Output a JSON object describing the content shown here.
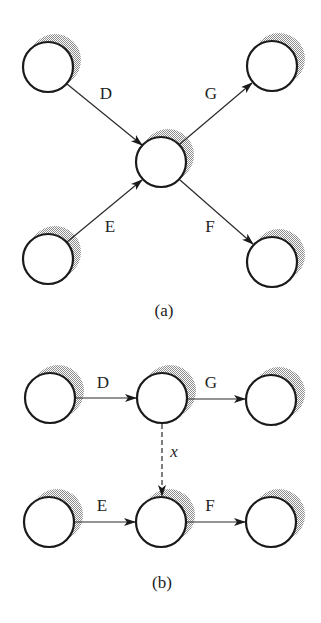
{
  "diagram": {
    "type": "network-activity-diagram",
    "colors": {
      "stroke": "#1a1a1a",
      "shadow": "#9a9a9a",
      "background": "#ffffff"
    },
    "panel_a": {
      "caption": "(a)",
      "nodes": [
        {
          "id": "a-tl",
          "cx": 48,
          "cy": 67
        },
        {
          "id": "a-tr",
          "cx": 272,
          "cy": 66
        },
        {
          "id": "a-center",
          "cx": 161,
          "cy": 162
        },
        {
          "id": "a-bl",
          "cx": 48,
          "cy": 259
        },
        {
          "id": "a-br",
          "cx": 272,
          "cy": 262
        }
      ],
      "edges": [
        {
          "label": "D",
          "from": "a-tl",
          "to": "a-center",
          "style": "solid"
        },
        {
          "label": "E",
          "from": "a-bl",
          "to": "a-center",
          "style": "solid"
        },
        {
          "label": "G",
          "from": "a-center",
          "to": "a-tr",
          "style": "solid"
        },
        {
          "label": "F",
          "from": "a-center",
          "to": "a-br",
          "style": "solid"
        }
      ]
    },
    "panel_b": {
      "caption": "(b)",
      "nodes": [
        {
          "id": "b-tl",
          "cx": 50,
          "cy": 398
        },
        {
          "id": "b-tm",
          "cx": 162,
          "cy": 398
        },
        {
          "id": "b-tr",
          "cx": 271,
          "cy": 400
        },
        {
          "id": "b-bl",
          "cx": 49,
          "cy": 522
        },
        {
          "id": "b-bm",
          "cx": 161,
          "cy": 522
        },
        {
          "id": "b-br",
          "cx": 271,
          "cy": 522
        }
      ],
      "edges": [
        {
          "label": "D",
          "from": "b-tl",
          "to": "b-tm",
          "style": "solid"
        },
        {
          "label": "G",
          "from": "b-tm",
          "to": "b-tr",
          "style": "solid"
        },
        {
          "label": "x",
          "from": "b-tm",
          "to": "b-bm",
          "style": "dashed"
        },
        {
          "label": "E",
          "from": "b-bl",
          "to": "b-bm",
          "style": "solid"
        },
        {
          "label": "F",
          "from": "b-bm",
          "to": "b-br",
          "style": "solid"
        }
      ]
    }
  },
  "labels": {
    "a_D": "D",
    "a_G": "G",
    "a_E": "E",
    "a_F": "F",
    "a_caption": "(a)",
    "b_D": "D",
    "b_G": "G",
    "b_x": "x",
    "b_E": "E",
    "b_F": "F",
    "b_caption": "(b)"
  }
}
